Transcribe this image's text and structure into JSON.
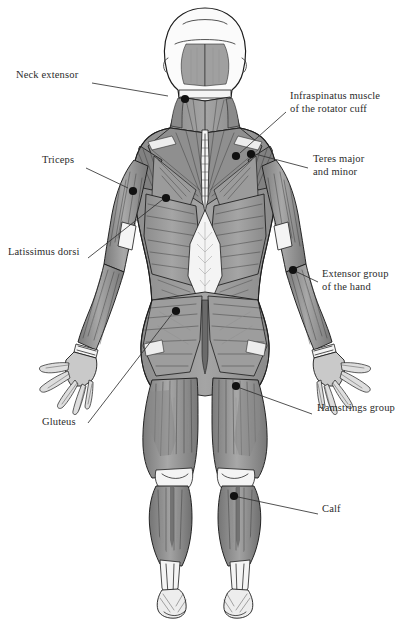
{
  "figure": {
    "view": "posterior",
    "palette": {
      "muscle_mid": "#9a9a9a",
      "muscle_dark": "#6f6f6f",
      "muscle_light": "#c4c4c4",
      "tendon": "#f2f2f2",
      "outline": "#1c1c1c",
      "marker": "#111111",
      "leader": "#333333",
      "background": "#ffffff"
    }
  },
  "labels": [
    {
      "id": "neck-extensor",
      "side": "left",
      "lines": [
        "Neck extensor"
      ],
      "text_x": 16,
      "text_y": 77,
      "leader": [
        [
          92,
          83
        ],
        [
          168,
          96
        ]
      ],
      "marker": [
        185,
        99
      ]
    },
    {
      "id": "triceps",
      "side": "left",
      "lines": [
        "Triceps"
      ],
      "text_x": 42,
      "text_y": 162,
      "leader": [
        [
          86,
          168
        ],
        [
          128,
          188
        ]
      ],
      "marker": [
        133,
        191
      ]
    },
    {
      "id": "latissimus-dorsi",
      "side": "left",
      "lines": [
        "Latissimus dorsi"
      ],
      "text_x": 8,
      "text_y": 254,
      "leader": [
        [
          88,
          258
        ],
        [
          162,
          200
        ]
      ],
      "marker": [
        166,
        198
      ]
    },
    {
      "id": "gluteus",
      "side": "left",
      "lines": [
        "Gluteus"
      ],
      "text_x": 42,
      "text_y": 424,
      "leader": [
        [
          88,
          423
        ],
        [
          172,
          314
        ]
      ],
      "marker": [
        176,
        311
      ]
    },
    {
      "id": "infraspinatus",
      "side": "right",
      "lines": [
        "Infraspinatus muscle",
        "of the rotator cuff"
      ],
      "text_x": 290,
      "text_y": 98,
      "leader": [
        [
          286,
          112
        ],
        [
          240,
          153
        ]
      ],
      "marker": [
        236,
        156
      ]
    },
    {
      "id": "teres-major-minor",
      "side": "right",
      "lines": [
        "Teres major",
        "and minor"
      ],
      "text_x": 313,
      "text_y": 161,
      "leader": [
        [
          308,
          168
        ],
        [
          255,
          154
        ]
      ],
      "marker": [
        251,
        154
      ]
    },
    {
      "id": "extensor-group-hand",
      "side": "right",
      "lines": [
        "Extensor group",
        "of the hand"
      ],
      "text_x": 322,
      "text_y": 276,
      "leader": [
        [
          318,
          282
        ],
        [
          297,
          272
        ]
      ],
      "marker": [
        293,
        270
      ]
    },
    {
      "id": "hamstrings-group",
      "side": "right",
      "lines": [
        "Hamstrings group"
      ],
      "text_x": 317,
      "text_y": 410,
      "leader": [
        [
          312,
          414
        ],
        [
          240,
          388
        ]
      ],
      "marker": [
        236,
        386
      ]
    },
    {
      "id": "calf",
      "side": "right",
      "lines": [
        "Calf"
      ],
      "text_x": 322,
      "text_y": 511,
      "leader": [
        [
          318,
          514
        ],
        [
          238,
          497
        ]
      ],
      "marker": [
        234,
        496
      ]
    }
  ]
}
